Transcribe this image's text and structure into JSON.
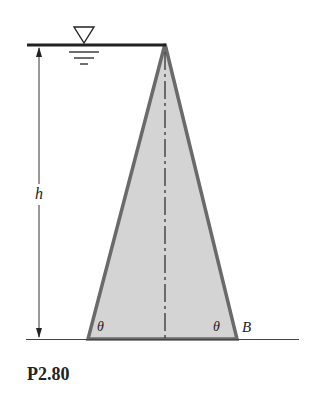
{
  "figure": {
    "caption": "P2.80",
    "labels": {
      "height": "h",
      "angle_left": "θ",
      "angle_right": "θ",
      "point": "B"
    },
    "colors": {
      "dam_fill": "#d4d4d4",
      "dam_outline": "#6a6a6a",
      "line": "#222222"
    }
  }
}
